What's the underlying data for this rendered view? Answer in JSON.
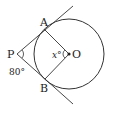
{
  "diagram": {
    "type": "geometry-tangents-circle",
    "points": {
      "P": {
        "label": "P"
      },
      "A": {
        "label": "A"
      },
      "B": {
        "label": "B"
      },
      "O": {
        "label": "O"
      }
    },
    "angles": {
      "APB": {
        "label": "80°"
      },
      "AOB": {
        "label": "x°"
      }
    },
    "colors": {
      "stroke": "#333333",
      "text": "#222222",
      "background": "#ffffff"
    }
  }
}
